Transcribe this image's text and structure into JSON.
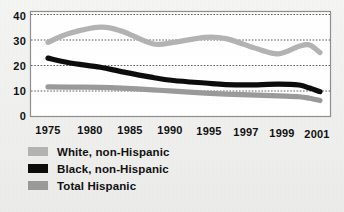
{
  "chart_data": {
    "type": "line",
    "title": "",
    "subtitle": "",
    "xlabel": "",
    "ylabel": "",
    "grid": true,
    "legend_position": "below",
    "xlim": [
      1975,
      2001
    ],
    "ylim": [
      0,
      40
    ],
    "ytick_labels": [
      "0",
      "10",
      "20",
      "30",
      "40"
    ],
    "ytick_values": [
      0,
      10,
      20,
      30,
      40
    ],
    "xtick_labels": [
      "1975",
      "1980",
      "1985",
      "1990",
      "1995",
      "1997",
      "1999",
      "2001"
    ],
    "xtick_values": [
      1975,
      1980,
      1985,
      1990,
      1995,
      1997,
      1999,
      2001
    ],
    "series": [
      {
        "name": "White, non-Hispanic",
        "color": "#b3b3b3",
        "x": [
          1975,
          1977,
          1980,
          1982,
          1985,
          1987,
          1990,
          1992,
          1995,
          1997,
          1999,
          2000,
          2001
        ],
        "values": [
          29.0,
          32.5,
          35.0,
          33.5,
          28.5,
          29.0,
          31.0,
          30.5,
          26.5,
          24.5,
          27.5,
          28.0,
          25.0
        ]
      },
      {
        "name": "Black, non-Hispanic",
        "color": "#0d0d0d",
        "x": [
          1975,
          1977,
          1980,
          1982,
          1985,
          1987,
          1990,
          1992,
          1995,
          1997,
          1999,
          2000,
          2001
        ],
        "values": [
          22.8,
          21.0,
          19.2,
          17.5,
          15.2,
          14.0,
          13.0,
          12.4,
          12.3,
          12.6,
          12.2,
          11.0,
          9.6
        ]
      },
      {
        "name": "Total Hispanic",
        "color": "#9a9a9a",
        "x": [
          1975,
          1977,
          1980,
          1982,
          1985,
          1987,
          1990,
          1992,
          1995,
          1997,
          1999,
          2000,
          2001
        ],
        "values": [
          11.5,
          11.4,
          11.3,
          11.0,
          10.3,
          9.8,
          9.0,
          8.6,
          8.2,
          7.9,
          7.6,
          7.0,
          6.1
        ]
      }
    ]
  },
  "axis": {
    "y_labels": [
      "40",
      "30",
      "20",
      "10",
      "0"
    ],
    "x_labels": [
      "1975",
      "1980",
      "1985",
      "1990",
      "1995",
      "1997",
      "1999",
      "2001"
    ]
  },
  "legend": {
    "items": [
      {
        "label": "White, non-Hispanic",
        "color": "#b3b3b3"
      },
      {
        "label": "Black, non-Hispanic",
        "color": "#0d0d0d"
      },
      {
        "label": "Total Hispanic",
        "color": "#9a9a9a"
      }
    ]
  }
}
